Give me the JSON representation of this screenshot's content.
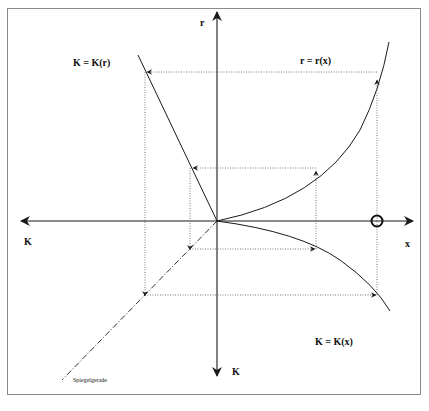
{
  "diagram": {
    "labels": {
      "k_of_r": "K = K(r)",
      "r_of_x": "r = r(x)",
      "k_of_x": "K = K(x)",
      "axis_top": "r",
      "axis_bottom": "K",
      "axis_left": "K",
      "axis_right": "x",
      "mirror_line": "Spiegelgerade"
    },
    "colors": {
      "line": "#1a1a1a",
      "dotted": "#555555",
      "frame": "#8a8a8a",
      "background": "#ffffff"
    },
    "origin": [
      217,
      221
    ],
    "marker": "circle-crosshair on x-axis"
  }
}
